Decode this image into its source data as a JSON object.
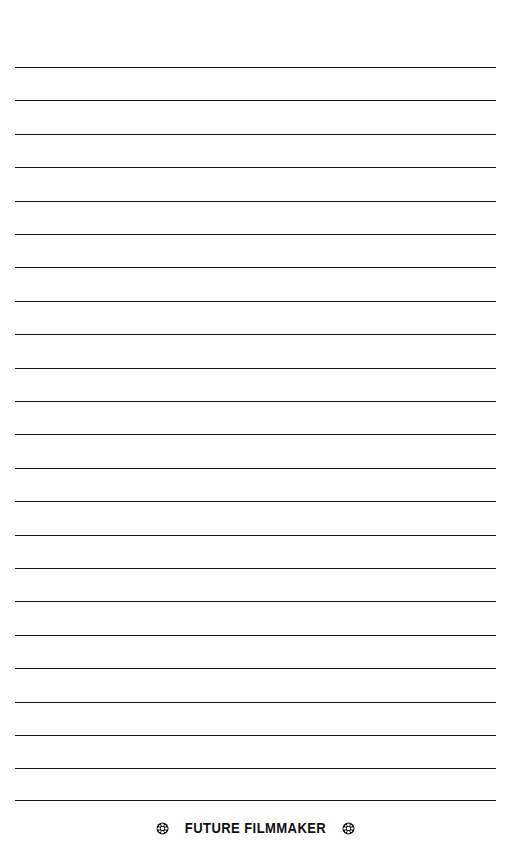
{
  "page": {
    "width": 511,
    "height": 860,
    "background_color": "#ffffff",
    "type": "lined-notebook-page"
  },
  "rules": {
    "count": 23,
    "color": "#151515",
    "thickness_px": 1.5,
    "left_x": 15,
    "right_x": 496,
    "first_y": 67,
    "spacing_px": 33.4,
    "y_positions": [
      67,
      100.4,
      133.8,
      167.2,
      200.6,
      234,
      267.4,
      300.8,
      334.2,
      367.6,
      401,
      434.4,
      467.8,
      501.2,
      534.6,
      568,
      601.4,
      634.8,
      668.2,
      701.6,
      735,
      768.4,
      800
    ]
  },
  "footer": {
    "title": "FUTURE FILMMAKER",
    "text_color": "#111111",
    "left_icon": "film-reel-icon",
    "right_icon": "film-reel-icon",
    "icon_color": "#111111"
  }
}
